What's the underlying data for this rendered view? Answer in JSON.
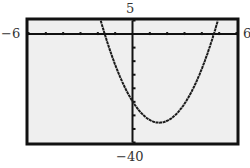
{
  "window": {
    "xmin_label": "−6",
    "xmax_label": "6",
    "ymin_label": "−40",
    "ymax_label": "5"
  },
  "chart_data": {
    "type": "line",
    "title": "",
    "xlabel": "",
    "ylabel": "",
    "xlim": [
      -6,
      6
    ],
    "ylim": [
      -40,
      5
    ],
    "xscale": 1,
    "yscale": 5,
    "grid": false,
    "legend": null,
    "series": [
      {
        "name": "parabola",
        "function": "y = 3.3x^2 - 10.2x - 24.8",
        "x_intercepts": [
          -1.6,
          4.7
        ],
        "y_intercept": -24.8,
        "vertex": [
          1.55,
          -32.7
        ],
        "x": [
          -1.83,
          -1.5,
          -1.0,
          -0.5,
          0.0,
          0.5,
          1.0,
          1.5,
          2.0,
          2.5,
          3.0,
          3.5,
          4.0,
          4.5,
          4.92
        ],
        "y": [
          5.0,
          -2.0,
          -11.3,
          -19.1,
          -24.8,
          -29.1,
          -31.7,
          -32.7,
          -32.0,
          -29.7,
          -25.7,
          -20.1,
          -12.8,
          -3.9,
          5.0
        ]
      }
    ],
    "colors": {
      "background": "#efefef",
      "frame": "#111111",
      "curve": "#1a1a1a",
      "axes": "#111111"
    }
  }
}
